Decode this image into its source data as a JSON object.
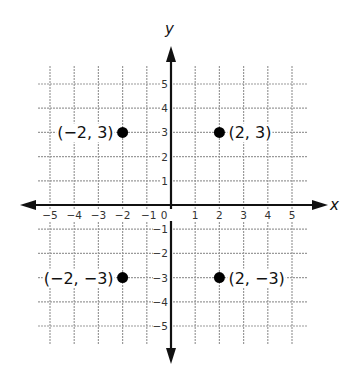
{
  "chart_data": {
    "type": "scatter",
    "title": "",
    "xlabel": "x",
    "ylabel": "y",
    "xlim": [
      -5.5,
      5.5
    ],
    "ylim": [
      -5.5,
      5.5
    ],
    "grid": true,
    "x_ticks": [
      -5,
      -4,
      -3,
      -2,
      -1,
      0,
      1,
      2,
      3,
      4,
      5
    ],
    "x_tick_labels": [
      "−5",
      "−4",
      "−3",
      "−2",
      "−1",
      "0",
      "1",
      "2",
      "3",
      "4",
      "5"
    ],
    "y_ticks": [
      5,
      4,
      3,
      2,
      1,
      -1,
      -2,
      -3,
      -4,
      -5
    ],
    "y_tick_labels": [
      "5",
      "4",
      "3",
      "2",
      "1",
      "−1",
      "−2",
      "−3",
      "−4",
      "−5"
    ],
    "points": [
      {
        "x": -2,
        "y": 3,
        "label": "(−2, 3)",
        "label_side": "left"
      },
      {
        "x": 2,
        "y": 3,
        "label": "(2, 3)",
        "label_side": "right"
      },
      {
        "x": -2,
        "y": -3,
        "label": "(−2, −3)",
        "label_side": "left"
      },
      {
        "x": 2,
        "y": -3,
        "label": "(2, −3)",
        "label_side": "right"
      }
    ]
  },
  "colors": {
    "grid": "#9a9a9a",
    "axis": "#111111",
    "point": "#000000"
  }
}
